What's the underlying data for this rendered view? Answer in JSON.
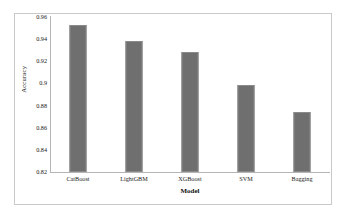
{
  "chart_data": {
    "type": "bar",
    "title": "",
    "subtitle": "",
    "categories": [
      "CatBoost",
      "LightGBM",
      "XGBoost",
      "SVM",
      "Bagging"
    ],
    "values": [
      0.953,
      0.938,
      0.928,
      0.899,
      0.874
    ],
    "series": [
      {
        "name": "Accuracy",
        "values": [
          0.953,
          0.938,
          0.928,
          0.899,
          0.874
        ]
      }
    ],
    "xlabel": "Model",
    "ylabel": "Accuracy",
    "ylim": [
      0.82,
      0.96
    ],
    "yticks": [
      0.82,
      0.84,
      0.86,
      0.88,
      0.9,
      0.92,
      0.94,
      0.96
    ],
    "ytick_labels": [
      "0.82",
      "0.84",
      "0.86",
      "0.88",
      "0.9",
      "0.92",
      "0.94",
      "0.96"
    ],
    "xtick_labels": [
      "CatBoost",
      "LightGBM",
      "XGBoost",
      "SVM",
      "Bagging"
    ],
    "grid": false,
    "legend": null,
    "legend_position": "none",
    "annotations": [],
    "bar_color": "#6f6f6f",
    "axis_color": "#b5b5b5",
    "frame_color": "#c9c9c9",
    "background_color": "#ffffff"
  }
}
